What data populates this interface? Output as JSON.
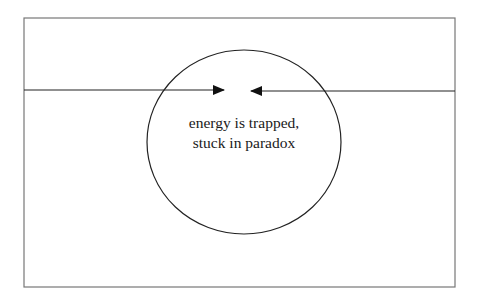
{
  "diagram": {
    "frame": {
      "x": 24,
      "y": 18,
      "width": 431,
      "height": 269,
      "stroke": "#777777"
    },
    "circle": {
      "cx": 244,
      "cy": 142,
      "rx": 97,
      "ry": 92,
      "stroke": "#222222"
    },
    "left_arrow": {
      "direction": "right",
      "from_x": 24,
      "to_x": 224,
      "y": 90
    },
    "right_arrow": {
      "direction": "left",
      "from_x": 455,
      "to_x": 251,
      "y": 91
    },
    "label": {
      "line1": "energy is trapped,",
      "line2": "stuck in paradox"
    }
  }
}
